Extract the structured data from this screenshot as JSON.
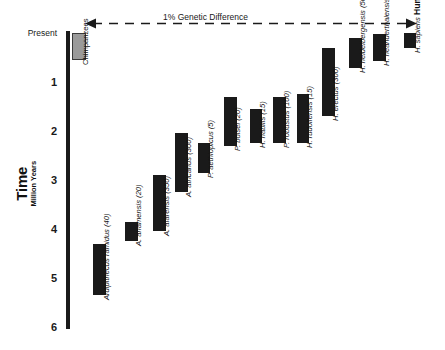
{
  "chart_data": {
    "type": "bar",
    "title": "",
    "annotation": "1% Genetic Difference",
    "ylabel_main": "Time",
    "ylabel_sub": "Million Years",
    "yaxis_ticks": [
      "Present",
      "1",
      "2",
      "3",
      "4",
      "5",
      "6"
    ],
    "ylim": [
      0,
      6
    ],
    "yaxis_inverted": true,
    "xlabel": "",
    "grid": false,
    "legend": false,
    "orientation": "vertical-time-ranges",
    "categories": [
      "Chimpanzees",
      "Ardipithecus ramidus (40)",
      "A. anamensis (20)",
      "A. afarensis (350)",
      "A. africanus (300)",
      "P. aethiopicus (5)",
      "P. boisei (20)",
      "H. habilis (15)",
      "P. robustus (100)",
      "H. rudolfensis (15)",
      "H. erectus (300)",
      "H. heidelbergensis (50)",
      "H. neanderthalensis (400)",
      "H. sapiens Humans"
    ],
    "bars": [
      {
        "name": "Chimpanzees",
        "label_italic": "",
        "label_plain": "Chimpanzees",
        "specimens": null,
        "start_ma": 0.0,
        "end_ma": 0.55,
        "color": "#9a9a9a",
        "outlined": true
      },
      {
        "name": "Ardipithecus ramidus",
        "label_italic": "Ardipithecus ramidus",
        "label_plain": "(40)",
        "specimens": 40,
        "start_ma": 4.3,
        "end_ma": 5.35,
        "color": "#1a1a1a",
        "outlined": false
      },
      {
        "name": "A. anamensis",
        "label_italic": "A. anamensis",
        "label_plain": "(20)",
        "specimens": 20,
        "start_ma": 3.85,
        "end_ma": 4.25,
        "color": "#1a1a1a",
        "outlined": false
      },
      {
        "name": "A. afarensis",
        "label_italic": "A. afarensis",
        "label_plain": "(350)",
        "specimens": 350,
        "start_ma": 2.9,
        "end_ma": 4.05,
        "color": "#1a1a1a",
        "outlined": false
      },
      {
        "name": "A. africanus",
        "label_italic": "A. africanus",
        "label_plain": "(300)",
        "specimens": 300,
        "start_ma": 2.05,
        "end_ma": 3.25,
        "color": "#1a1a1a",
        "outlined": false
      },
      {
        "name": "P. aethiopicus",
        "label_italic": "P. aethiopicus",
        "label_plain": "(5)",
        "specimens": 5,
        "start_ma": 2.25,
        "end_ma": 2.85,
        "color": "#1a1a1a",
        "outlined": false
      },
      {
        "name": "P. boisei",
        "label_italic": "P. boisei",
        "label_plain": "(20)",
        "specimens": 20,
        "start_ma": 1.3,
        "end_ma": 2.3,
        "color": "#1a1a1a",
        "outlined": false
      },
      {
        "name": "H. habilis",
        "label_italic": "H. habilis",
        "label_plain": "(15)",
        "specimens": 15,
        "start_ma": 1.55,
        "end_ma": 2.25,
        "color": "#1a1a1a",
        "outlined": false
      },
      {
        "name": "P. robustus",
        "label_italic": "P. robustus",
        "label_plain": "(100)",
        "specimens": 100,
        "start_ma": 1.3,
        "end_ma": 2.25,
        "color": "#1a1a1a",
        "outlined": false
      },
      {
        "name": "H. rudolfensis",
        "label_italic": "H. rudolfensis",
        "label_plain": "(15)",
        "specimens": 15,
        "start_ma": 1.25,
        "end_ma": 2.25,
        "color": "#1a1a1a",
        "outlined": false
      },
      {
        "name": "H. erectus",
        "label_italic": "H. erectus",
        "label_plain": "(300)",
        "specimens": 300,
        "start_ma": 0.3,
        "end_ma": 1.7,
        "color": "#1a1a1a",
        "outlined": false
      },
      {
        "name": "H. heidelbergensis",
        "label_italic": "H. heidelbergensis",
        "label_plain": "(50)",
        "specimens": 50,
        "start_ma": 0.1,
        "end_ma": 0.72,
        "color": "#1a1a1a",
        "outlined": false
      },
      {
        "name": "H. neanderthalensis",
        "label_italic": "H. neanderthalensis",
        "label_plain": "(400)",
        "specimens": 400,
        "start_ma": 0.02,
        "end_ma": 0.58,
        "color": "#1a1a1a",
        "outlined": false
      },
      {
        "name": "H. sapiens",
        "label_italic": "H. sapiens",
        "label_plain": "Humans",
        "label_bold": "Humans",
        "specimens": null,
        "start_ma": 0.0,
        "end_ma": 0.3,
        "color": "#1a1a1a",
        "outlined": false
      }
    ]
  }
}
